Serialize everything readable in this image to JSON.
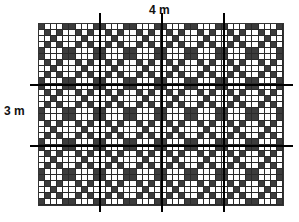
{
  "labels": {
    "width": "4 m",
    "height": "3 m"
  },
  "grid": {
    "columns": 40,
    "rows": 30,
    "cells_per_meter": 10,
    "width_m": 4,
    "height_m": 3,
    "pattern": {
      "description": "Diagonal diamond lattice of dark cells with 10-cell period",
      "period": 10,
      "dark_if_sum_mod": [
        4,
        9
      ],
      "dark_if_diff_mod": [
        0,
        5
      ]
    },
    "colors": {
      "dark_cell": "#3c3c3c",
      "light_cell": "#ffffff",
      "grid_line": "#2a2a2a",
      "meter_line": "#000000"
    }
  },
  "meter_lines": {
    "vertical_x_px": [
      99,
      161,
      223
    ],
    "horizontal_y_px": [
      84,
      145
    ],
    "vertical_span_px": [
      13,
      212
    ],
    "horizontal_span_px": [
      30,
      293
    ]
  }
}
